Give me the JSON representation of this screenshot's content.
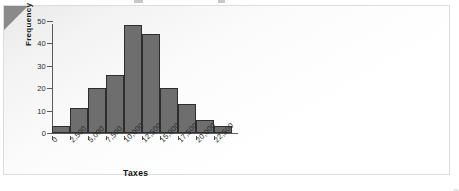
{
  "figure": {
    "credit": "© Cengage Learning"
  },
  "chart_data": {
    "type": "bar",
    "title": "",
    "xlabel": "Taxes",
    "ylabel": "Frequency",
    "categories": [
      "0",
      "2,500",
      "5,000",
      "7,500",
      "10,000",
      "12,500",
      "15,000",
      "17,500",
      "20,000",
      "22,500"
    ],
    "values": [
      3,
      11,
      20,
      26,
      48,
      44,
      20,
      13,
      6,
      3
    ],
    "ylim": [
      0,
      50
    ],
    "yticks": [
      0,
      10,
      20,
      30,
      40,
      50
    ],
    "ytick_labels": [
      "0",
      "10",
      "20",
      "30",
      "40",
      "50"
    ],
    "grid": false,
    "legend": "none",
    "bar_color": "#6e6e6e",
    "bar_edge_color": "#2e2e2e"
  }
}
